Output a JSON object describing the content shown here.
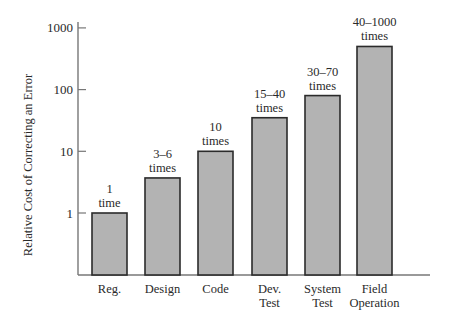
{
  "chart_data": {
    "type": "bar",
    "title": "",
    "xlabel": "",
    "ylabel": "Relative Cost of Correcting an Error",
    "yscale": "log",
    "ylim": [
      0.2,
      1000
    ],
    "yticks": [
      1,
      10,
      100,
      1000
    ],
    "ytick_labels": [
      "1",
      "10",
      "100",
      "1000"
    ],
    "grid": false,
    "legend": null,
    "categories": [
      "Reg.",
      "Design",
      "Code",
      "Dev. Test",
      "System Test",
      "Field Operation"
    ],
    "category_lines": [
      [
        "Reg."
      ],
      [
        "Design"
      ],
      [
        "Code"
      ],
      [
        "Dev.",
        "Test"
      ],
      [
        "System",
        "Test"
      ],
      [
        "Field",
        "Operation"
      ]
    ],
    "values": [
      1,
      3.7,
      10,
      35,
      80,
      500
    ],
    "annotations": [
      [
        "1",
        "time"
      ],
      [
        "3–6",
        "times"
      ],
      [
        "10",
        "times"
      ],
      [
        "15–40",
        "times"
      ],
      [
        "30–70",
        "times"
      ],
      [
        "40–1000",
        "times"
      ]
    ],
    "bar_color": "#b3b3b3",
    "bar_edge_color": "#2b2b2b"
  }
}
